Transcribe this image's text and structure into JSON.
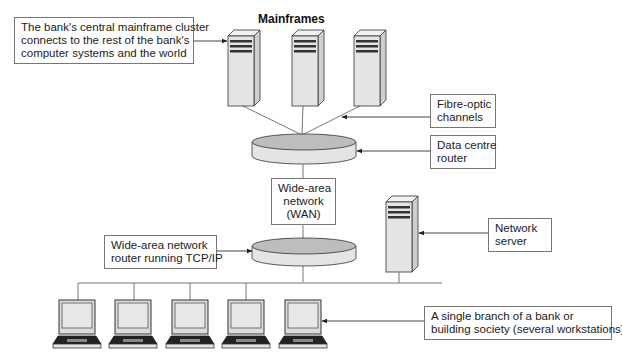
{
  "diagram": {
    "title": "Mainframes",
    "labels": {
      "mainframe_cluster": [
        "The bank's central mainframe cluster",
        "connects to the rest of the bank's",
        "computer systems and the world"
      ],
      "fibre_optic": [
        "Fibre-optic",
        "channels"
      ],
      "data_centre_router": [
        "Data centre",
        "router"
      ],
      "wan": [
        "Wide-area",
        "network",
        "(WAN)"
      ],
      "wan_router": [
        "Wide-area network",
        "router running TCP/IP"
      ],
      "network_server": [
        "Network",
        "server"
      ],
      "branch": [
        "A single branch of a bank or",
        "building society (several workstations)"
      ]
    },
    "nodes": {
      "mainframes": [
        "mainframe-1",
        "mainframe-2",
        "mainframe-3"
      ],
      "routers": [
        "data-centre-router",
        "wan-router"
      ],
      "servers": [
        "network-server"
      ],
      "workstations": [
        "workstation-1",
        "workstation-2",
        "workstation-3",
        "workstation-4",
        "workstation-5"
      ]
    },
    "colors": {
      "line": "#777777",
      "device_fill": "#e4e4e4",
      "device_side": "#cfcfcf",
      "device_stroke": "#333333",
      "router_top": "#bdbdbd"
    }
  }
}
